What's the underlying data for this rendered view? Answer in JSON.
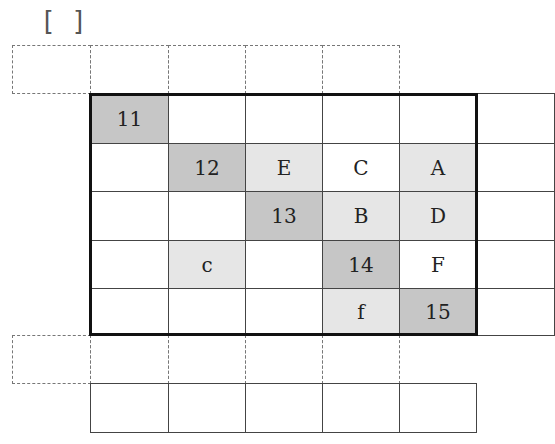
{
  "header": {
    "bracket": "[  ]"
  },
  "grid": {
    "columns_x": [
      12,
      90,
      168,
      245,
      322,
      399,
      476,
      554
    ],
    "rows_y": [
      45,
      93,
      143,
      191,
      240,
      288,
      335,
      383,
      432
    ],
    "top_dashed_row": [
      "",
      "",
      "",
      "",
      ""
    ],
    "main_rows": [
      [
        {
          "t": "11",
          "s": "dark"
        },
        {
          "t": "",
          "s": ""
        },
        {
          "t": "",
          "s": ""
        },
        {
          "t": "",
          "s": ""
        },
        {
          "t": "",
          "s": ""
        },
        {
          "t": "",
          "s": ""
        }
      ],
      [
        {
          "t": "",
          "s": ""
        },
        {
          "t": "12",
          "s": "dark"
        },
        {
          "t": "E",
          "s": "light"
        },
        {
          "t": "C",
          "s": ""
        },
        {
          "t": "A",
          "s": "light"
        },
        {
          "t": "",
          "s": ""
        }
      ],
      [
        {
          "t": "",
          "s": ""
        },
        {
          "t": "",
          "s": ""
        },
        {
          "t": "13",
          "s": "dark"
        },
        {
          "t": "B",
          "s": "light"
        },
        {
          "t": "D",
          "s": "light"
        },
        {
          "t": "",
          "s": ""
        }
      ],
      [
        {
          "t": "",
          "s": ""
        },
        {
          "t": "c",
          "s": "light"
        },
        {
          "t": "",
          "s": ""
        },
        {
          "t": "14",
          "s": "dark"
        },
        {
          "t": "F",
          "s": ""
        },
        {
          "t": "",
          "s": ""
        }
      ],
      [
        {
          "t": "",
          "s": ""
        },
        {
          "t": "",
          "s": ""
        },
        {
          "t": "",
          "s": ""
        },
        {
          "t": "f",
          "s": "light"
        },
        {
          "t": "15",
          "s": "dark"
        },
        {
          "t": "",
          "s": ""
        }
      ]
    ],
    "bottom_dashed_row": [
      "",
      "",
      "",
      "",
      ""
    ],
    "bottom_solid_row": [
      "",
      "",
      "",
      "",
      ""
    ]
  },
  "colors": {
    "dark_shade": "#c6c6c6",
    "light_shade": "#e6e6e6",
    "border": "#111111"
  }
}
